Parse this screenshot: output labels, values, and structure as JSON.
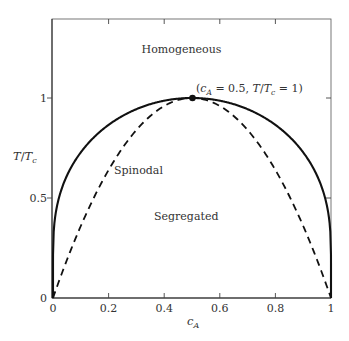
{
  "chart_data": {
    "type": "line",
    "title": "",
    "xlabel": "c_A",
    "ylabel": "T/T_c",
    "xlim": [
      0,
      1
    ],
    "ylim": [
      0,
      1.4
    ],
    "grid": false,
    "legend": null,
    "x_ticks": [
      0,
      0.2,
      0.4,
      0.6,
      0.8,
      1
    ],
    "x_tick_labels": [
      "0",
      "0.2",
      "0.4",
      "0.6",
      "0.8",
      "1"
    ],
    "y_ticks": [
      0,
      0.5,
      1
    ],
    "y_tick_labels": [
      "0",
      "0.5",
      "1"
    ],
    "series": [
      {
        "name": "Binodal (coexistence curve)",
        "style": "solid",
        "color": "#111111",
        "formula": "T/Tc = 2(1-2c)/ln((1-c)/c)",
        "x": [
          0.0,
          0.001,
          0.005,
          0.01,
          0.02,
          0.05,
          0.1,
          0.15,
          0.2,
          0.25,
          0.3,
          0.35,
          0.4,
          0.45,
          0.5,
          0.55,
          0.6,
          0.65,
          0.7,
          0.75,
          0.8,
          0.85,
          0.9,
          0.95,
          0.98,
          0.99,
          0.995,
          0.999,
          1.0
        ],
        "values": [
          0.0,
          0.289,
          0.377,
          0.425,
          0.49,
          0.614,
          0.728,
          0.81,
          0.866,
          0.91,
          0.944,
          0.969,
          0.987,
          0.997,
          1.0,
          0.997,
          0.987,
          0.969,
          0.944,
          0.91,
          0.866,
          0.81,
          0.728,
          0.614,
          0.49,
          0.425,
          0.377,
          0.289,
          0.0
        ]
      },
      {
        "name": "Spinodal",
        "style": "dashed",
        "color": "#111111",
        "formula": "T/Tc = 4c(1-c)",
        "x": [
          0.0,
          0.05,
          0.1,
          0.15,
          0.2,
          0.25,
          0.3,
          0.35,
          0.4,
          0.45,
          0.5,
          0.55,
          0.6,
          0.65,
          0.7,
          0.75,
          0.8,
          0.85,
          0.9,
          0.95,
          1.0
        ],
        "values": [
          0.0,
          0.19,
          0.36,
          0.51,
          0.64,
          0.75,
          0.84,
          0.91,
          0.96,
          0.99,
          1.0,
          0.99,
          0.96,
          0.91,
          0.84,
          0.75,
          0.64,
          0.51,
          0.36,
          0.19,
          0.0
        ]
      }
    ],
    "critical_point": {
      "x": 0.5,
      "y": 1.0,
      "label": "(c_A = 0.5, T/T_c = 1)"
    },
    "annotations": [
      {
        "text": "Homogeneous",
        "x": 0.5,
        "y": 1.25
      },
      {
        "text": "Spinodal",
        "x": 0.29,
        "y": 0.64
      },
      {
        "text": "Segregated",
        "x": 0.48,
        "y": 0.41
      }
    ]
  },
  "labels": {
    "homogeneous": "Homogeneous",
    "spinodal": "Spinodal",
    "segregated": "Segregated",
    "annot_open": "(",
    "annot_c": "c",
    "annot_A": "A",
    "annot_mid": " = 0.5, ",
    "annot_T": "T",
    "annot_slash": "/",
    "annot_T2": "T",
    "annot_csub": "c",
    "annot_end": " = 1)",
    "xlabel_c": "c",
    "xlabel_sub": "A",
    "ylabel_T": "T",
    "ylabel_slash": "/",
    "ylabel_T2": "T",
    "ylabel_sub": "c"
  },
  "ticks": {
    "x": [
      "0",
      "0.2",
      "0.4",
      "0.6",
      "0.8",
      "1"
    ],
    "y": [
      "0",
      "0.5",
      "1"
    ]
  }
}
